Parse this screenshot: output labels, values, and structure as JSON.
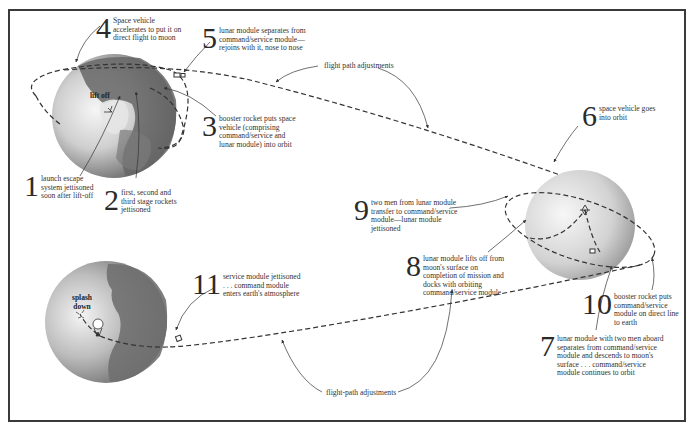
{
  "diagram": {
    "bodies": {
      "earth_launch": {
        "label": "lift off"
      },
      "earth_return": {
        "label": "splash down"
      },
      "moon": {
        "label": ""
      }
    },
    "steps": [
      {
        "number": "1",
        "text": "launch escape system jettisoned soon after lift-off"
      },
      {
        "number": "2",
        "text": "first, second and third stage rockets jettisoned"
      },
      {
        "number": "3",
        "text": "booster rocket puts space vehicle (comprising command/service and lunar module) into orbit"
      },
      {
        "number": "4",
        "text": "Space vehicle accelerates to put it on direct flight to moon"
      },
      {
        "number": "5",
        "text": "lunar module separates from command/service module—rejoins with it, nose to nose"
      },
      {
        "number": "6",
        "text": "space vehicle goes into orbit"
      },
      {
        "number": "7",
        "text": "lunar module with two men aboard separates from command/service module and descends to moon's surface . . . command/service module continues to orbit"
      },
      {
        "number": "8",
        "text": "lunar module lifts off from moon's surface on completion of mission and docks with orbiting command/service module"
      },
      {
        "number": "9",
        "text": "two men from lunar module transfer to command/service module—lunar module jettisoned"
      },
      {
        "number": "10",
        "text": "booster rocket puts command/service module on direct line to earth"
      },
      {
        "number": "11",
        "text": "service module jettisoned . . . command module enters earth's atmosphere"
      }
    ],
    "captions": {
      "outbound_adjustments": "flight path adjustments",
      "return_adjustments": "flight-path adjustments"
    },
    "colors": {
      "line": "#333333",
      "earth_light": "#f2f2f2",
      "earth_dark": "#5a5a5a",
      "moon_light": "#f4f4f4",
      "moon_dark": "#a8a8a8"
    }
  }
}
